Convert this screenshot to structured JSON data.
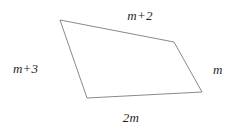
{
  "figure": {
    "type": "geometry-diagram",
    "shape": "quadrilateral",
    "background_color": "#ffffff",
    "stroke_color": "#8a8a8a",
    "stroke_width": 1,
    "text_color": "#1f1f1f",
    "vertices": [
      {
        "name": "top-left",
        "x": 60,
        "y": 20
      },
      {
        "name": "top-right",
        "x": 174,
        "y": 42
      },
      {
        "name": "bottom-right",
        "x": 202,
        "y": 92
      },
      {
        "name": "bottom-left",
        "x": 87,
        "y": 98
      }
    ],
    "polygon_points": "60,20 174,42 202,92 87,98",
    "side_labels": {
      "top": "m+2",
      "right": "m",
      "bottom": "2m",
      "left": "m+3"
    }
  }
}
